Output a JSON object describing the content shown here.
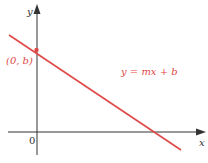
{
  "diagram": {
    "type": "coordinate-plane-line",
    "colors": {
      "axis": "#333333",
      "line": "#e04848",
      "background": "#ffffff"
    },
    "axes": {
      "x_label": "x",
      "y_label": "y",
      "origin_label": "0"
    },
    "line": {
      "equation_label": "y = mx + b",
      "intercept_label": "(0, b)",
      "slope_sign": "negative"
    }
  }
}
